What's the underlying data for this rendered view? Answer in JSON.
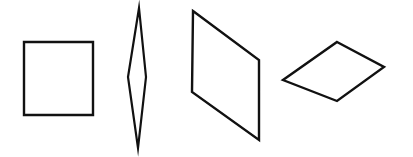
{
  "figure": {
    "title": "Four quadrilaterals",
    "background_color": "#ffffff",
    "stroke_color": "#111111",
    "fill_color": "#ffffff",
    "canvas": {
      "width": 413,
      "height": 157
    },
    "shape_count": "4"
  },
  "shapes": [
    {
      "id": "square",
      "name": "square",
      "label": "Square",
      "stroke_color": "#111111",
      "fill_color": "#ffffff",
      "stroke_width": 2.4,
      "points": "24,42 93,42 93,115 24,115",
      "vertices": [
        {
          "x": 24,
          "y": 42
        },
        {
          "x": 93,
          "y": 42
        },
        {
          "x": 93,
          "y": 115
        },
        {
          "x": 24,
          "y": 115
        }
      ]
    },
    {
      "id": "thin-kite",
      "name": "thin-vertical-kite",
      "label": "Thin vertical kite",
      "stroke_color": "#111111",
      "fill_color": "#ffffff",
      "stroke_width": 2.2,
      "points": "139,8 146,77 138,148 128,77",
      "vertices": [
        {
          "x": 139,
          "y": 8
        },
        {
          "x": 146,
          "y": 77
        },
        {
          "x": 138,
          "y": 148
        },
        {
          "x": 128,
          "y": 77
        }
      ]
    },
    {
      "id": "parallelogram",
      "name": "slanted-parallelogram",
      "label": "Parallelogram",
      "stroke_color": "#111111",
      "fill_color": "#ffffff",
      "stroke_width": 2.4,
      "points": "193,11 259,60 259,140 192,92",
      "vertices": [
        {
          "x": 193,
          "y": 11
        },
        {
          "x": 259,
          "y": 60
        },
        {
          "x": 259,
          "y": 140
        },
        {
          "x": 192,
          "y": 92
        }
      ]
    },
    {
      "id": "rhombus",
      "name": "rhombus-diamond",
      "label": "Rhombus",
      "stroke_color": "#111111",
      "fill_color": "#ffffff",
      "stroke_width": 2.4,
      "points": "337,42 384,67 337,101 283,80",
      "vertices": [
        {
          "x": 337,
          "y": 42
        },
        {
          "x": 384,
          "y": 67
        },
        {
          "x": 337,
          "y": 101
        },
        {
          "x": 283,
          "y": 80
        }
      ]
    }
  ]
}
